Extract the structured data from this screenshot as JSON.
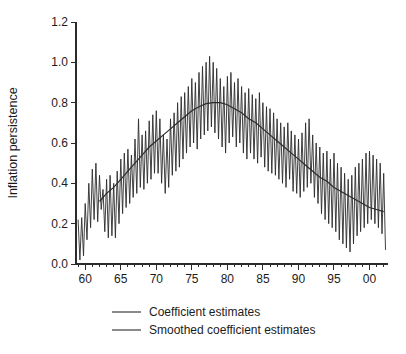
{
  "figure": {
    "background": "#ffffff",
    "axis_color": "#2b2b2b",
    "text_color": "#1c1c1c"
  },
  "chart_data": {
    "type": "line",
    "title": "",
    "xlabel": "",
    "ylabel": "Inflation persistence",
    "ylim": [
      0.0,
      1.2
    ],
    "xlim": [
      1958.7,
      2002.6
    ],
    "grid": false,
    "legend_position": "bottom",
    "yticks": [
      0.0,
      0.2,
      0.4,
      0.6,
      0.8,
      1.0,
      1.2
    ],
    "ytick_labels": [
      "0.0",
      "0.2",
      "0.4",
      "0.6",
      "0.8",
      "1.0",
      "1.2"
    ],
    "xticks": [
      1960,
      1965,
      1970,
      1975,
      1980,
      1985,
      1990,
      1995,
      2000
    ],
    "xtick_labels": [
      "60",
      "65",
      "70",
      "75",
      "80",
      "85",
      "90",
      "95",
      "00"
    ],
    "minor_xticks_start": 1959,
    "minor_xticks_end": 2002,
    "minor_xticks_step": 1,
    "series": [
      {
        "name": "Coefficient estimates",
        "color": "#2b2b2b",
        "stroke_width": 0.9,
        "x_start": 1959.0,
        "x_step": 0.25,
        "values": [
          0.22,
          0.02,
          0.23,
          0.04,
          0.3,
          0.12,
          0.4,
          0.18,
          0.47,
          0.22,
          0.5,
          0.21,
          0.44,
          0.27,
          0.37,
          0.16,
          0.42,
          0.13,
          0.44,
          0.14,
          0.4,
          0.13,
          0.46,
          0.2,
          0.52,
          0.25,
          0.55,
          0.28,
          0.57,
          0.3,
          0.54,
          0.33,
          0.62,
          0.35,
          0.72,
          0.38,
          0.64,
          0.37,
          0.66,
          0.4,
          0.71,
          0.42,
          0.74,
          0.45,
          0.76,
          0.45,
          0.72,
          0.4,
          0.64,
          0.35,
          0.62,
          0.38,
          0.72,
          0.44,
          0.75,
          0.46,
          0.8,
          0.48,
          0.83,
          0.52,
          0.85,
          0.55,
          0.88,
          0.58,
          0.92,
          0.6,
          0.9,
          0.57,
          0.95,
          0.62,
          0.98,
          0.64,
          1.0,
          0.66,
          1.03,
          0.68,
          1.0,
          0.65,
          0.97,
          0.62,
          0.92,
          0.58,
          0.88,
          0.55,
          0.93,
          0.6,
          0.95,
          0.63,
          0.9,
          0.58,
          0.92,
          0.6,
          0.88,
          0.55,
          0.85,
          0.52,
          0.87,
          0.55,
          0.84,
          0.52,
          0.82,
          0.5,
          0.85,
          0.53,
          0.8,
          0.48,
          0.78,
          0.46,
          0.77,
          0.45,
          0.75,
          0.44,
          0.72,
          0.42,
          0.7,
          0.4,
          0.68,
          0.38,
          0.7,
          0.42,
          0.66,
          0.36,
          0.64,
          0.35,
          0.62,
          0.33,
          0.65,
          0.36,
          0.7,
          0.38,
          0.72,
          0.4,
          0.64,
          0.33,
          0.6,
          0.3,
          0.58,
          0.25,
          0.55,
          0.22,
          0.56,
          0.2,
          0.52,
          0.18,
          0.55,
          0.16,
          0.5,
          0.12,
          0.48,
          0.1,
          0.45,
          0.08,
          0.42,
          0.06,
          0.44,
          0.1,
          0.48,
          0.14,
          0.5,
          0.16,
          0.52,
          0.18,
          0.55,
          0.2,
          0.56,
          0.22,
          0.54,
          0.2,
          0.52,
          0.18,
          0.5,
          0.15,
          0.45,
          0.07
        ]
      },
      {
        "name": "Smoothed coefficient estimates",
        "color": "#2b2b2b",
        "stroke_width": 1.2,
        "x_start": 1962.0,
        "x_step": 1.0,
        "values": [
          0.31,
          0.35,
          0.38,
          0.42,
          0.46,
          0.5,
          0.54,
          0.58,
          0.61,
          0.64,
          0.67,
          0.7,
          0.73,
          0.76,
          0.78,
          0.795,
          0.8,
          0.8,
          0.79,
          0.77,
          0.75,
          0.72,
          0.7,
          0.67,
          0.64,
          0.61,
          0.58,
          0.55,
          0.52,
          0.49,
          0.46,
          0.43,
          0.41,
          0.38,
          0.36,
          0.34,
          0.32,
          0.3,
          0.28,
          0.27,
          0.26
        ]
      }
    ]
  }
}
